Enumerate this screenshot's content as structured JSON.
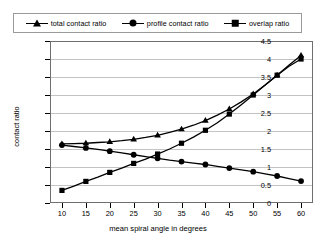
{
  "legend": {
    "position": "top",
    "entries": [
      {
        "label": "total contact ratio",
        "marker": "triangle-marker-icon"
      },
      {
        "label": "profile contact ratio",
        "marker": "circle-marker-icon"
      },
      {
        "label": "overlap ratio",
        "marker": "square-marker-icon"
      }
    ]
  },
  "axes": {
    "x_title": "mean spiral angle in degrees",
    "y_title": "contact ratio",
    "x_ticks": [
      "10",
      "15",
      "20",
      "25",
      "30",
      "35",
      "40",
      "45",
      "50",
      "55",
      "60"
    ],
    "y_ticks": [
      "0",
      "0.5",
      "1",
      "1.5",
      "2",
      "2.5",
      "3",
      "3.5",
      "4",
      "4.5"
    ]
  },
  "chart_data": {
    "type": "line",
    "title": "",
    "subtitle": "",
    "xlabel": "mean spiral angle in degrees",
    "ylabel": "contact ratio",
    "xlim": [
      7.5,
      62.5
    ],
    "ylim": [
      0,
      4.5
    ],
    "xticks": [
      10,
      15,
      20,
      25,
      30,
      35,
      40,
      45,
      50,
      55,
      60
    ],
    "yticks": [
      0,
      0.5,
      1,
      1.5,
      2,
      2.5,
      3,
      3.5,
      4,
      4.5
    ],
    "grid": "horizontal",
    "legend_position": "top",
    "x": [
      10,
      12.5,
      15,
      17.5,
      20,
      22.5,
      25,
      27.5,
      30,
      32.5,
      35,
      37.5,
      40,
      42.5,
      45,
      47.5,
      50,
      52.5,
      55,
      57.5,
      60
    ],
    "series": [
      {
        "name": "total contact ratio",
        "marker": "triangle",
        "color": "#000000",
        "values": [
          1.64,
          1.65,
          1.66,
          1.68,
          1.7,
          1.73,
          1.77,
          1.82,
          1.88,
          1.96,
          2.05,
          2.16,
          2.29,
          2.44,
          2.61,
          2.81,
          3.03,
          3.28,
          3.55,
          3.83,
          4.1
        ]
      },
      {
        "name": "profile contact ratio",
        "marker": "circle",
        "color": "#000000",
        "values": [
          1.61,
          1.57,
          1.53,
          1.49,
          1.44,
          1.39,
          1.34,
          1.29,
          1.24,
          1.19,
          1.15,
          1.11,
          1.07,
          1.02,
          0.97,
          0.92,
          0.87,
          0.81,
          0.75,
          0.68,
          0.61
        ]
      },
      {
        "name": "overlap ratio",
        "marker": "square",
        "color": "#000000",
        "values": [
          0.35,
          0.47,
          0.6,
          0.72,
          0.85,
          0.97,
          1.1,
          1.22,
          1.36,
          1.5,
          1.66,
          1.83,
          2.02,
          2.23,
          2.47,
          2.73,
          3.0,
          3.28,
          3.55,
          3.8,
          4.0
        ]
      }
    ]
  }
}
